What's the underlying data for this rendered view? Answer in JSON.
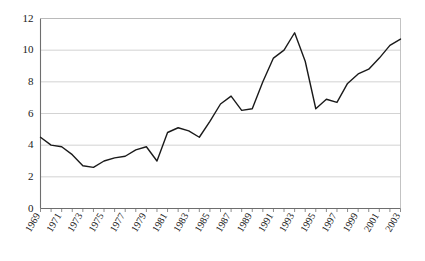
{
  "chart_data": {
    "type": "line",
    "title": "",
    "subtitle": "",
    "xlabel": "",
    "ylabel": "",
    "xlim": [
      1969,
      2003
    ],
    "ylim": [
      0,
      12
    ],
    "grid": true,
    "legend": false,
    "legend_position": "none",
    "line_color": "#1a1a1a",
    "grid_color": "#c8c8c8",
    "axis_color": "#6e6e6e",
    "y_ticks": [
      0,
      2,
      4,
      6,
      8,
      10,
      12
    ],
    "y_tick_labels": [
      "0",
      "2",
      "4",
      "6",
      "8",
      "10",
      "12"
    ],
    "x_tick_labels": [
      "1969",
      "1971",
      "1973",
      "1975",
      "1977",
      "1979",
      "1981",
      "1983",
      "1985",
      "1987",
      "1989",
      "1991",
      "1993",
      "1995",
      "1997",
      "1999",
      "2001",
      "2003"
    ],
    "x": [
      1969,
      1970,
      1971,
      1972,
      1973,
      1974,
      1975,
      1976,
      1977,
      1978,
      1979,
      1980,
      1981,
      1982,
      1983,
      1984,
      1985,
      1986,
      1987,
      1988,
      1989,
      1990,
      1991,
      1992,
      1993,
      1994,
      1995,
      1996,
      1997,
      1998,
      1999,
      2000,
      2001,
      2002,
      2003
    ],
    "values": [
      4.5,
      4.0,
      3.9,
      3.4,
      2.7,
      2.6,
      3.0,
      3.2,
      3.3,
      3.7,
      3.9,
      3.0,
      4.8,
      5.1,
      4.9,
      4.5,
      5.5,
      6.6,
      7.1,
      6.2,
      6.3,
      8.0,
      9.5,
      10.0,
      11.1,
      9.3,
      6.3,
      6.9,
      6.7,
      7.9,
      8.5,
      8.8,
      9.5,
      10.3,
      10.7
    ],
    "series": [
      {
        "name": "series-1",
        "values": [
          4.5,
          4.0,
          3.9,
          3.4,
          2.7,
          2.6,
          3.0,
          3.2,
          3.3,
          3.7,
          3.9,
          3.0,
          4.8,
          5.1,
          4.9,
          4.5,
          5.5,
          6.6,
          7.1,
          6.2,
          6.3,
          8.0,
          9.5,
          10.0,
          11.1,
          9.3,
          6.3,
          6.9,
          6.7,
          7.9,
          8.5,
          8.8,
          9.5,
          10.3,
          10.7
        ]
      }
    ]
  }
}
